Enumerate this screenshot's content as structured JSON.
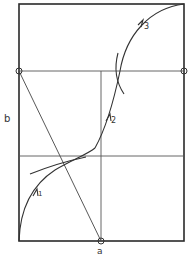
{
  "figure": {
    "width": 190,
    "height": 258,
    "colors": {
      "background": "#ffffff",
      "ink": "#333333"
    },
    "labels": {
      "a": "a",
      "b": "b",
      "step1": "1",
      "step2": "2",
      "step3": "3"
    },
    "frame": {
      "x1": 19,
      "y1": 4,
      "x2": 184,
      "y2": 241
    },
    "horizontal_lines": [
      {
        "name": "upper-horizontal",
        "y": 71
      },
      {
        "name": "lower-horizontal",
        "y": 156
      }
    ],
    "vertical_line": {
      "x": 101,
      "y1": 71,
      "y2": 241
    },
    "diagonal": {
      "x1": 19,
      "y1": 71,
      "x2": 101,
      "y2": 241
    },
    "marked_points": [
      {
        "name": "point-left",
        "x": 19,
        "y": 71
      },
      {
        "name": "point-right",
        "x": 184,
        "y": 71
      },
      {
        "name": "point-a",
        "x": 101,
        "y": 241
      }
    ]
  }
}
